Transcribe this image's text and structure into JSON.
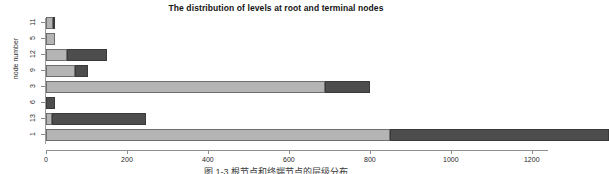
{
  "chart_data": {
    "type": "bar",
    "orientation": "horizontal",
    "stacked": true,
    "title": "The distribution of levels at root and terminal nodes",
    "xlabel": "",
    "ylabel": "node number",
    "categories": [
      "11",
      "5",
      "12",
      "9",
      "3",
      "6",
      "13",
      "1"
    ],
    "xlim": [
      0,
      1250
    ],
    "xticks": [
      0,
      200,
      400,
      600,
      800,
      1000,
      1200
    ],
    "xticklabels": [
      "0",
      "200",
      "400",
      "600",
      "800",
      "1000",
      "1200"
    ],
    "grid": false,
    "legend": "none",
    "series": [
      {
        "name": "root",
        "color": "#b4b4b4",
        "values": [
          18,
          22,
          52,
          72,
          690,
          0,
          15,
          850
        ]
      },
      {
        "name": "terminal",
        "color": "#4d4d4d",
        "values": [
          4,
          0,
          98,
          31,
          110,
          22,
          233,
          540
        ]
      }
    ],
    "totals": [
      22,
      22,
      150,
      103,
      800,
      22,
      248,
      1390
    ]
  },
  "caption": "图 1-3 根节点和终端节点的层级分布",
  "colors": {
    "root_segment": "#b4b4b4",
    "terminal_segment": "#4d4d4d",
    "axis": "#8f8f8f",
    "background": "#ffffff"
  }
}
